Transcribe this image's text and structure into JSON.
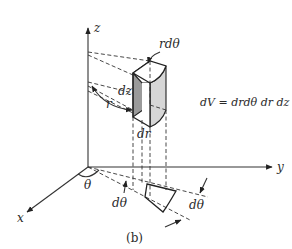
{
  "figure": {
    "caption": "(b)",
    "axes": {
      "z": "z",
      "y": "y",
      "x": "x"
    },
    "labels": {
      "r_dtheta": "rdθ",
      "dz": "dz",
      "r": "r",
      "dr": "dr",
      "theta": "θ",
      "dtheta_left": "dθ",
      "dtheta_right": "dθ"
    },
    "equation": "dV = drdθ dr dz",
    "colors": {
      "line": "#333333",
      "shaded_face": "#9a9a9a",
      "side_face": "#c8c8c8",
      "background": "#ffffff"
    }
  }
}
